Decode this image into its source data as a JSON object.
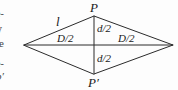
{
  "figure": {
    "type": "geometry-diagram",
    "shape": "rhombus",
    "stroke_color": "#2b2b2b",
    "background_color": "#fdfdfd",
    "labels": {
      "apex_top": "P",
      "apex_bottom": "P′",
      "side": "l",
      "half_diagonal_major_left": "D/2",
      "half_diagonal_major_right": "D/2",
      "half_diagonal_minor_top": "d/2",
      "half_diagonal_minor_bottom": "d/2"
    },
    "vertices": {
      "top": [
        94,
        16
      ],
      "right": [
        173,
        45
      ],
      "bottom": [
        94,
        74
      ],
      "left": [
        24,
        45
      ]
    }
  },
  "clipped_text_column": {
    "note": "partial glyphs from neighbouring body text cropped at the left edge",
    "lines": [
      "e-",
      "y",
      "le",
      "e-",
      "p′"
    ]
  }
}
